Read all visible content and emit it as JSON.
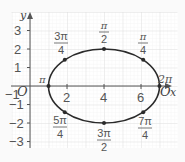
{
  "diagram": {
    "type": "parametric-ellipse",
    "axes": {
      "x_label": "x",
      "y_label": "y",
      "origin_label": "O",
      "x_ticks": [
        "2",
        "4",
        "6"
      ],
      "y_ticks": [
        "3",
        "2",
        "1",
        "−1",
        "−2",
        "−3"
      ],
      "x_neg_tick": "−1"
    },
    "ellipse": {
      "center": [
        4,
        0
      ],
      "rx": 3,
      "ry": 2
    },
    "points": [
      {
        "angle": "0 / 2π",
        "x": 7,
        "y": 0
      },
      {
        "angle": "π/4",
        "x": 6.12,
        "y": 1.41
      },
      {
        "angle": "π/2",
        "x": 4,
        "y": 2
      },
      {
        "angle": "3π/4",
        "x": 1.88,
        "y": 1.41
      },
      {
        "angle": "π",
        "x": 1,
        "y": 0
      },
      {
        "angle": "5π/4",
        "x": 1.88,
        "y": -1.41
      },
      {
        "angle": "3π/2",
        "x": 4,
        "y": -2
      },
      {
        "angle": "7π/4",
        "x": 6.12,
        "y": -1.41
      }
    ],
    "labels": {
      "pi": "π",
      "two_pi": "2π",
      "pi_over_2_num": "π",
      "pi_over_2_den": "2",
      "three_pi_over_4_num": "3π",
      "three_pi_over_4_den": "4",
      "pi_over_4_num": "π",
      "pi_over_4_den": "4",
      "five_pi_over_4_num": "5π",
      "five_pi_over_4_den": "4",
      "three_pi_over_2_num": "3π",
      "three_pi_over_2_den": "2",
      "seven_pi_over_4_num": "7π",
      "seven_pi_over_4_den": "4",
      "right_origin": "O"
    },
    "colors": {
      "curve": "#2a2a2a",
      "grid": "#e2e2e2",
      "axis": "#555555"
    }
  }
}
